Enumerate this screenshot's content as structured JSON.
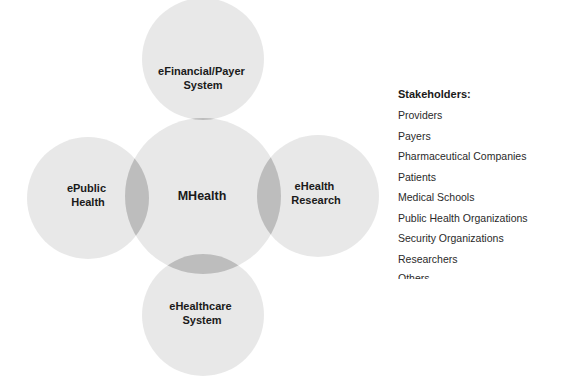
{
  "diagram": {
    "center": {
      "label": "MHealth"
    },
    "satellites": [
      {
        "position": "top",
        "lines": [
          "eFinancial/Payer",
          "System"
        ]
      },
      {
        "position": "left",
        "lines": [
          "ePublic",
          "Health"
        ]
      },
      {
        "position": "right",
        "lines": [
          "eHealth",
          "Research"
        ]
      },
      {
        "position": "bottom",
        "lines": [
          "eHealthcare",
          "System"
        ]
      }
    ],
    "colors": {
      "circle_fill": "#e6e6e6",
      "overlap_fill": "#bdbdbd",
      "text": "#1a1a1a"
    }
  },
  "legend": {
    "title": "Stakeholders:",
    "items": [
      "Providers",
      "Payers",
      "Pharmaceutical Companies",
      "Patients",
      "Medical Schools",
      "Public Health Organizations",
      "Security Organizations",
      "Researchers",
      "Others"
    ]
  }
}
